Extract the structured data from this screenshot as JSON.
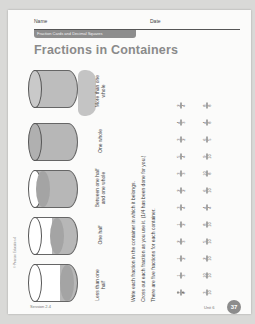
{
  "header": {
    "name_label": "Name",
    "date_label": "Date",
    "banner": "Fraction Cards and Decimal Squares"
  },
  "title": "Fractions in Containers",
  "containers": [
    {
      "label": "More than one whole"
    },
    {
      "label": "One whole"
    },
    {
      "label": "Between one half and one whole"
    },
    {
      "label": "One half",
      "example": "1/2"
    },
    {
      "label": "Less than one half"
    }
  ],
  "instructions": [
    "Write each fraction in the container in which it belongs.",
    "Cross out each fraction as you use it. (1/4 has been done for you.)",
    "There are five fractions for each container."
  ],
  "fractions": {
    "column1": [
      "1/4",
      "1/3",
      "1/2",
      "2/3",
      "1/2",
      "3/4",
      "2/2",
      "3/3",
      "5/4",
      "3/2",
      "4/3",
      "2/4"
    ],
    "column2": [
      "3/10",
      "10/10",
      "2/10",
      "5/10",
      "8/10",
      "4/4",
      "6/10",
      "10/8",
      "9/10",
      "6/5",
      "4/8",
      "8/8"
    ]
  },
  "footer": {
    "lesson": "Session 2.4",
    "unit": "Unit 6",
    "page_number": "37",
    "copyright": "© Pearson Education 4"
  }
}
